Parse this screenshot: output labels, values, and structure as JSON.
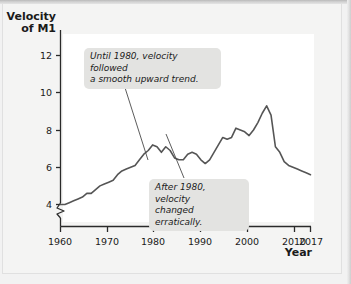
{
  "figure": {
    "background_color": "#f4f4f3",
    "plot_background_color": "#ffffff"
  },
  "axes": {
    "y_title_line1": "Velocity",
    "y_title_line2": "of M1",
    "x_title": "Year",
    "y_ticks": [
      "12",
      "10",
      "8",
      "6",
      "4"
    ],
    "x_ticks": [
      "1960",
      "1970",
      "1980",
      "1990",
      "2000",
      "2010",
      "2017"
    ],
    "y_axis_break": true
  },
  "annotations": {
    "callout_1": "Until 1980, velocity followed\na smooth upward trend.",
    "callout_2": "After 1980, velocity\nchanged erratically."
  },
  "chart_data": {
    "type": "line",
    "title": "",
    "subtitle": "",
    "xlabel": "Year",
    "ylabel": "Velocity of M1",
    "xlim": [
      1960,
      2017
    ],
    "ylim": [
      3.4,
      12.6
    ],
    "grid": false,
    "legend": null,
    "y_tick_values": [
      4,
      6,
      8,
      10,
      12
    ],
    "x_tick_values": [
      1960,
      1970,
      1980,
      1990,
      2000,
      2010,
      2017
    ],
    "line_color": "#555555",
    "line_width": 1.6,
    "series": [
      {
        "name": "Velocity of M1",
        "x": [
          1960,
          1961,
          1962,
          1963,
          1964,
          1965,
          1966,
          1967,
          1968,
          1969,
          1970,
          1971,
          1972,
          1973,
          1974,
          1975,
          1976,
          1977,
          1978,
          1979,
          1980,
          1981,
          1982,
          1983,
          1984,
          1985,
          1986,
          1987,
          1988,
          1989,
          1990,
          1991,
          1992,
          1993,
          1994,
          1995,
          1996,
          1997,
          1998,
          1999,
          2000,
          2001,
          2002,
          2003,
          2004,
          2005,
          2006,
          2007,
          2008,
          2009,
          2010,
          2011,
          2012,
          2013,
          2014,
          2015,
          2016,
          2017
        ],
        "values": [
          4.0,
          4.0,
          4.1,
          4.2,
          4.3,
          4.4,
          4.6,
          4.6,
          4.8,
          5.0,
          5.1,
          5.2,
          5.3,
          5.6,
          5.8,
          5.9,
          6.0,
          6.1,
          6.4,
          6.7,
          6.9,
          7.2,
          7.1,
          6.8,
          7.1,
          6.9,
          6.5,
          6.4,
          6.4,
          6.7,
          6.8,
          6.7,
          6.4,
          6.2,
          6.4,
          6.8,
          7.2,
          7.6,
          7.5,
          7.6,
          8.1,
          8.0,
          7.9,
          7.7,
          8.0,
          8.4,
          8.9,
          9.3,
          8.8,
          7.1,
          6.8,
          6.3,
          6.1,
          6.0,
          5.9,
          5.8,
          5.7,
          5.6
        ]
      }
    ],
    "annotations": [
      {
        "text": "Until 1980, velocity followed a smooth upward trend.",
        "points_to_x": 1973,
        "points_to_y": 5.7
      },
      {
        "text": "After 1980, velocity changed erratically.",
        "points_to_x": 1982,
        "points_to_y": 7.2
      }
    ]
  }
}
